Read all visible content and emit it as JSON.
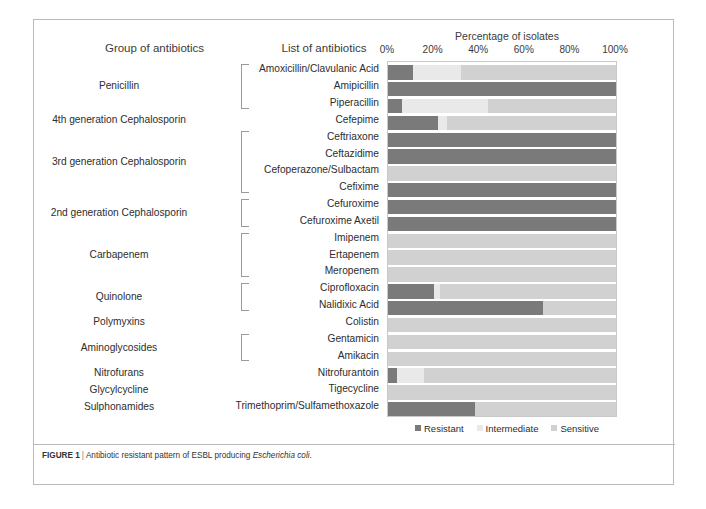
{
  "header": {
    "group_column_title": "Group of antibiotics",
    "list_column_title": "List of antibiotics",
    "axis_title": "Percentage of isolates"
  },
  "axis": {
    "ticks": [
      "0%",
      "20%",
      "40%",
      "60%",
      "80%",
      "100%"
    ],
    "min": 0,
    "max": 100
  },
  "legend": {
    "items": [
      {
        "label": "Resistant",
        "color": "#7a7a7a"
      },
      {
        "label": "Intermediate",
        "color": "#e9e9e9"
      },
      {
        "label": "Sensitive",
        "color": "#d1d1d1"
      }
    ]
  },
  "caption": {
    "figure_label": "FIGURE 1",
    "separator": "|",
    "text_before_italic": "Antibiotic resistant pattern of ESBL producing ",
    "italic_text": "Escherichia coli",
    "text_after_italic": "."
  },
  "groups": [
    {
      "name": "Penicillin",
      "rows": 3
    },
    {
      "name": "4th generation Cephalosporin",
      "rows": 1
    },
    {
      "name": "3rd generation Cephalosporin",
      "rows": 4
    },
    {
      "name": "2nd generation Cephalosporin",
      "rows": 2
    },
    {
      "name": "Carbapenem",
      "rows": 3
    },
    {
      "name": "Quinolone",
      "rows": 2
    },
    {
      "name": "Polymyxins",
      "rows": 1
    },
    {
      "name": "Aminoglycosides",
      "rows": 2
    },
    {
      "name": "Nitrofurans",
      "rows": 1
    },
    {
      "name": "Glycylcycline",
      "rows": 1
    },
    {
      "name": "Sulphonamides",
      "rows": 1
    }
  ],
  "chart_data": {
    "type": "bar",
    "orientation": "horizontal",
    "stacked": true,
    "title": "Percentage of isolates",
    "xlabel": "Percentage of isolates",
    "ylabel": "List of antibiotics",
    "xlim": [
      0,
      100
    ],
    "grid": false,
    "legend_position": "bottom",
    "categories": [
      "Amoxicillin/Clavulanic Acid",
      "Amipicillin",
      "Piperacillin",
      "Cefepime",
      "Ceftriaxone",
      "Ceftazidime",
      "Cefoperazone/Sulbactam",
      "Cefixime",
      "Cefuroxime",
      "Cefuroxime Axetil",
      "Imipenem",
      "Ertapenem",
      "Meropenem",
      "Ciprofloxacin",
      "Nalidixic Acid",
      "Colistin",
      "Gentamicin",
      "Amikacin",
      "Nitrofurantoin",
      "Tigecycline",
      "Trimethoprim/Sulfamethoxazole"
    ],
    "series": [
      {
        "name": "Resistant",
        "color": "#7a7a7a",
        "values": [
          11,
          100,
          6,
          22,
          100,
          100,
          0,
          100,
          100,
          100,
          0,
          0,
          0,
          20,
          68,
          0,
          0,
          0,
          4,
          0,
          38
        ]
      },
      {
        "name": "Intermediate",
        "color": "#e9e9e9",
        "values": [
          21,
          0,
          38,
          4,
          0,
          0,
          0,
          0,
          0,
          0,
          0,
          0,
          0,
          3,
          0,
          0,
          0,
          0,
          12,
          0,
          0
        ]
      },
      {
        "name": "Sensitive",
        "color": "#d1d1d1",
        "values": [
          68,
          0,
          56,
          74,
          0,
          0,
          100,
          0,
          0,
          0,
          100,
          100,
          100,
          77,
          32,
          100,
          100,
          100,
          84,
          100,
          62
        ]
      }
    ]
  }
}
